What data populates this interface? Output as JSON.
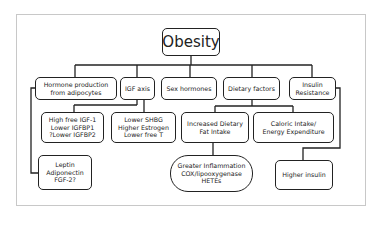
{
  "diagram": {
    "root": "Obesity",
    "categories": [
      {
        "id": "hormone",
        "label": "Hormone production\nfrom adipocytes"
      },
      {
        "id": "igf",
        "label": "IGF axis"
      },
      {
        "id": "sex",
        "label": "Sex hormones"
      },
      {
        "id": "dietary",
        "label": "Dietary factors"
      },
      {
        "id": "insulin",
        "label": "Insulin\nResistance"
      }
    ],
    "effects": {
      "igf_effects": "High free IGF-1\nLower IGFBP1\n?Lower IGFBP2",
      "sex_effects": "Lower SHBG\nHigher Estrogen\nLower free T",
      "fat_intake": "Increased Dietary\nFat Intake",
      "caloric": "Caloric Intake/\nEnergy Expenditure",
      "adipokines": "Leptin\nAdiponectin\nFGF-2?",
      "inflammation": "Greater Inflammation\nCOX/lipooxygenase\nHETEs",
      "higher_insulin": "Higher insulin"
    },
    "colors": {
      "line": "#222222",
      "frame": "#c8c8c8"
    }
  }
}
